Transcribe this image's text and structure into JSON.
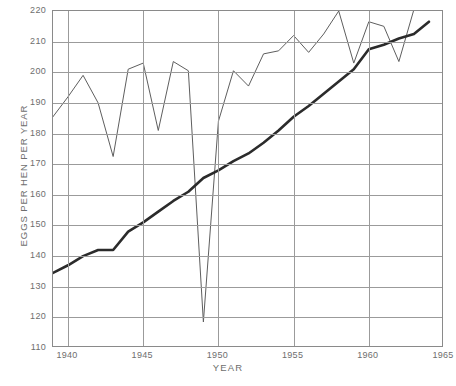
{
  "chart_data": {
    "type": "line",
    "title": "",
    "xlabel": "YEAR",
    "ylabel": "EGGS PER HEN PER YEAR",
    "xlim": [
      1939,
      1965
    ],
    "ylim": [
      110,
      220
    ],
    "grid": true,
    "legend": "none",
    "x_ticks": [
      1940,
      1945,
      1950,
      1955,
      1960,
      1965
    ],
    "y_ticks": [
      110,
      120,
      130,
      140,
      150,
      160,
      170,
      180,
      190,
      200,
      210,
      220
    ],
    "x_tick_labels": [
      "1940",
      "1945",
      "1950",
      "1955",
      "1960",
      "1965"
    ],
    "y_tick_labels": [
      "110",
      "120",
      "130",
      "140",
      "150",
      "160",
      "170",
      "180",
      "190",
      "200",
      "210",
      "220"
    ],
    "series": [
      {
        "name": "annual-flock-rate",
        "style": "thin",
        "color": "#5e5e5e",
        "x": [
          1939,
          1940,
          1941,
          1942,
          1943,
          1944,
          1945,
          1946,
          1947,
          1948,
          1949,
          1950,
          1951,
          1952,
          1953,
          1954,
          1955,
          1956,
          1957,
          1958,
          1959,
          1960,
          1961,
          1962,
          1963,
          1964
        ],
        "values": [
          185.5,
          192.0,
          199.0,
          190.0,
          172.5,
          201.0,
          203.0,
          181.0,
          203.5,
          200.5,
          118.5,
          184.0,
          200.5,
          195.5,
          206.0,
          207.0,
          212.0,
          206.5,
          212.5,
          220.0,
          203.0,
          216.5,
          215.0,
          203.5,
          220.5,
          221.0
        ]
      },
      {
        "name": "national-average-rate",
        "style": "thick",
        "color": "#2b2b2b",
        "x": [
          1939,
          1940,
          1941,
          1942,
          1943,
          1944,
          1945,
          1946,
          1947,
          1948,
          1949,
          1950,
          1951,
          1952,
          1953,
          1954,
          1955,
          1956,
          1957,
          1958,
          1959,
          1960,
          1961,
          1962,
          1963,
          1964
        ],
        "values": [
          134.5,
          137.0,
          140.0,
          142.0,
          142.0,
          148.0,
          151.0,
          154.5,
          158.0,
          161.0,
          165.5,
          168.0,
          171.0,
          173.5,
          177.0,
          181.0,
          185.5,
          189.0,
          193.0,
          197.0,
          201.0,
          207.5,
          209.0,
          211.0,
          212.5,
          216.5
        ]
      }
    ]
  },
  "axes": {
    "y_title": "EGGS PER HEN PER YEAR",
    "x_title": "YEAR"
  },
  "caption": {
    "text": ""
  }
}
